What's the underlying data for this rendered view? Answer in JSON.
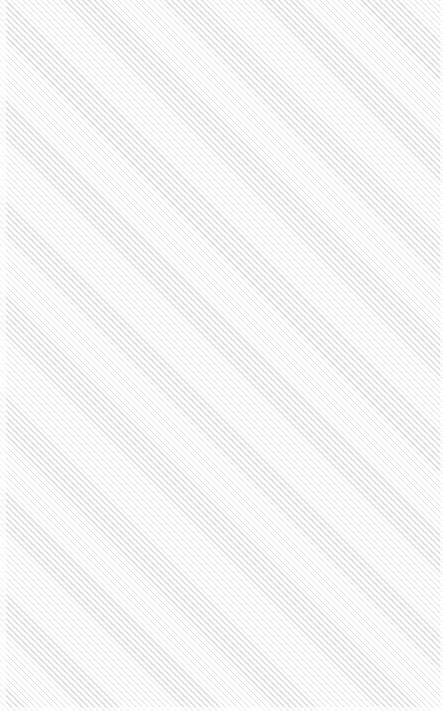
{
  "panel": {
    "kind": "empty-hatched-placeholder",
    "label": "",
    "colors": {
      "background": "#ffffff",
      "hatch": "#dcdcdc"
    }
  }
}
